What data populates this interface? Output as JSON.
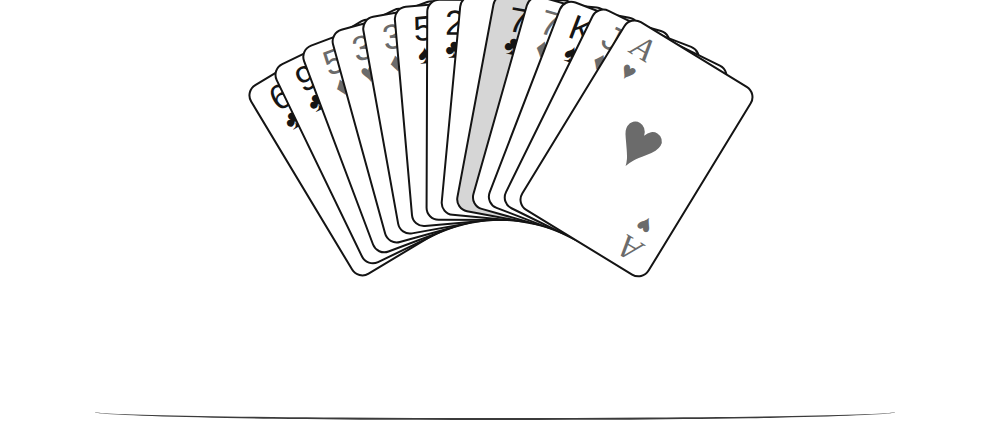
{
  "scene": {
    "title": "Fan of playing cards",
    "background_color": "#ffffff",
    "ink_color": "#141414",
    "black_suit_color": "#151515",
    "red_suit_color": "#6b6b6b",
    "selected_card_fill": "#d6d6d6",
    "card_count": 13
  },
  "glyphs": {
    "club": "♣",
    "spade": "♠",
    "heart": "♥",
    "diamond": "♦"
  },
  "cards": [
    {
      "id": "card-6-clubs",
      "rank": "6",
      "suit": "club",
      "suit_glyph": "♣",
      "color_class": "black",
      "label": "Six of Clubs",
      "selected": false,
      "type": "pip"
    },
    {
      "id": "card-9-clubs",
      "rank": "9",
      "suit": "club",
      "suit_glyph": "♣",
      "color_class": "black",
      "label": "Nine of Clubs",
      "selected": false,
      "type": "pip"
    },
    {
      "id": "card-5-diamonds",
      "rank": "5",
      "suit": "diamond",
      "suit_glyph": "♦",
      "color_class": "red",
      "label": "Five of Diamonds",
      "selected": false,
      "type": "pip"
    },
    {
      "id": "card-3-hearts",
      "rank": "3",
      "suit": "heart",
      "suit_glyph": "♥",
      "color_class": "red",
      "label": "Three of Hearts",
      "selected": false,
      "type": "pip"
    },
    {
      "id": "card-3-diamonds",
      "rank": "3",
      "suit": "diamond",
      "suit_glyph": "♦",
      "color_class": "red",
      "label": "Three of Diamonds",
      "selected": false,
      "type": "pip"
    },
    {
      "id": "card-5-spades",
      "rank": "5",
      "suit": "spade",
      "suit_glyph": "♠",
      "color_class": "black",
      "label": "Five of Spades",
      "selected": false,
      "type": "pip"
    },
    {
      "id": "card-2-clubs",
      "rank": "2",
      "suit": "club",
      "suit_glyph": "♣",
      "color_class": "black",
      "label": "Two of Clubs",
      "selected": false,
      "type": "pip"
    },
    {
      "id": "card-joker",
      "rank": "JOKER",
      "suit": "",
      "suit_glyph": "",
      "color_class": "black",
      "label": "Joker",
      "selected": false,
      "type": "joker"
    },
    {
      "id": "card-7-clubs",
      "rank": "7",
      "suit": "club",
      "suit_glyph": "♣",
      "color_class": "black",
      "label": "Seven of Clubs",
      "selected": true,
      "type": "pip"
    },
    {
      "id": "card-7-diamonds",
      "rank": "7",
      "suit": "diamond",
      "suit_glyph": "♦",
      "color_class": "red",
      "label": "Seven of Diamonds",
      "selected": false,
      "type": "pip"
    },
    {
      "id": "card-k-spades",
      "rank": "K",
      "suit": "spade",
      "suit_glyph": "♠",
      "color_class": "black",
      "label": "King of Spades",
      "selected": false,
      "type": "court"
    },
    {
      "id": "card-j-diamonds",
      "rank": "J",
      "suit": "diamond",
      "suit_glyph": "♦",
      "color_class": "red",
      "label": "Jack of Diamonds",
      "selected": false,
      "type": "court"
    },
    {
      "id": "card-a-hearts",
      "rank": "A",
      "suit": "heart",
      "suit_glyph": "♥",
      "color_class": "red",
      "label": "Ace of Hearts",
      "selected": false,
      "type": "ace"
    }
  ],
  "joker_text": {
    "letters": [
      "J",
      "O",
      "K",
      "E",
      "R"
    ]
  },
  "layout": {
    "fan_pivot_x": 500,
    "fan_pivot_y": 372,
    "angle_start": -31,
    "angle_step": 5.2,
    "card_width": 150,
    "card_height": 222
  }
}
